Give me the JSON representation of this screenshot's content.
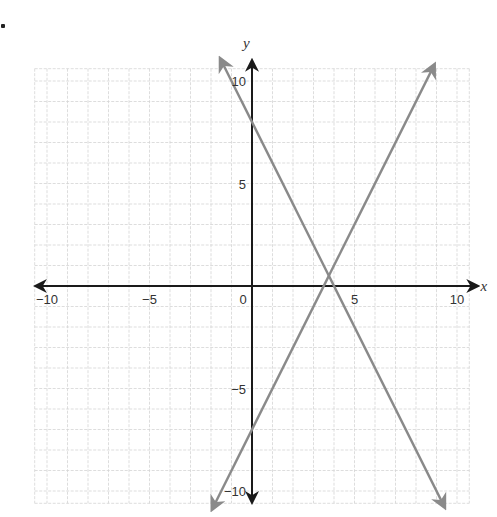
{
  "chart_data": {
    "type": "line",
    "title": "",
    "xlabel": "x",
    "ylabel": "y",
    "xlim": [
      -10,
      10
    ],
    "ylim": [
      -10,
      10
    ],
    "grid": true,
    "grid_step": 1,
    "x_ticks": [
      {
        "value": -10,
        "label": "−10"
      },
      {
        "value": -5,
        "label": "−5"
      },
      {
        "value": 0,
        "label": "0"
      },
      {
        "value": 5,
        "label": "5"
      },
      {
        "value": 10,
        "label": "10"
      }
    ],
    "y_ticks": [
      {
        "value": 10,
        "label": "10"
      },
      {
        "value": 5,
        "label": "5"
      },
      {
        "value": -5,
        "label": "−5"
      },
      {
        "value": -10,
        "label": "−10"
      }
    ],
    "series": [
      {
        "name": "line-increasing",
        "equation": "y = 2x - 7",
        "slope": 2,
        "intercept": -7,
        "x": [
          -1.95,
          8.9
        ],
        "y": [
          -10.9,
          10.8
        ],
        "color": "#8a8a8a",
        "arrows": "both"
      },
      {
        "name": "line-decreasing",
        "equation": "y = -2x + 8",
        "slope": -2,
        "intercept": 8,
        "x": [
          -1.55,
          9.4
        ],
        "y": [
          11.1,
          -10.8
        ],
        "color": "#8a8a8a",
        "arrows": "both"
      }
    ],
    "intersection": {
      "x": 3.75,
      "y": 0.5
    },
    "legend": null
  },
  "colors": {
    "grid": "#d4d4d4",
    "axis": "#1a1a1a",
    "lines": "#8a8a8a",
    "text": "#333333"
  },
  "geometry": {
    "origin_px": [
      252,
      286
    ],
    "unit_px": 20.5
  }
}
